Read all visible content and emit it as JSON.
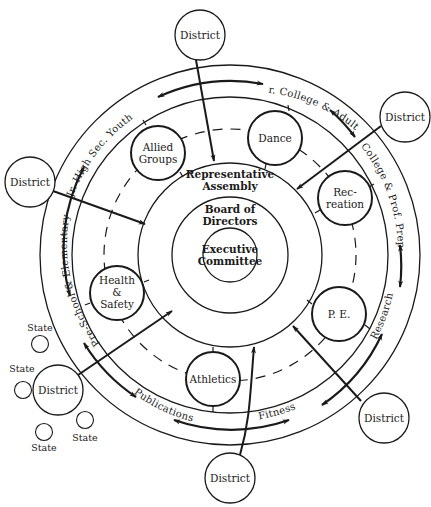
{
  "diagram": {
    "type": "organizational-concentric",
    "center": {
      "x": 230,
      "y": 255
    },
    "colors": {
      "line": "#1a1a1a",
      "background": "#ffffff"
    },
    "core": {
      "executive_committee": {
        "line1": "Executive",
        "line2": "Committee"
      },
      "board_of_directors": {
        "line1": "Board of",
        "line2": "Directors"
      },
      "representative_assembly": {
        "line1": "Representative",
        "line2": "Assembly"
      }
    },
    "divisions": [
      {
        "id": "allied-groups",
        "line1": "Allied",
        "line2": "Groups",
        "line3": ""
      },
      {
        "id": "dance",
        "line1": "Dance",
        "line2": "",
        "line3": ""
      },
      {
        "id": "recreation",
        "line1": "Rec-",
        "line2": "reation",
        "line3": ""
      },
      {
        "id": "pe",
        "line1": "P. E.",
        "line2": "",
        "line3": ""
      },
      {
        "id": "athletics",
        "line1": "Athletics",
        "line2": "",
        "line3": ""
      },
      {
        "id": "health-safety",
        "line1": "Health",
        "line2": "&",
        "line3": "Safety"
      }
    ],
    "ring_labels": {
      "jr_high": "Jr. High Sec. Youth",
      "jr_college": "Jr. College & Adults",
      "college": "College & Prof. Prep.",
      "research": "Research",
      "fitness": "Fitness",
      "publications": "Publications",
      "preschool": "Pre-School & Elementary"
    },
    "districts": [
      {
        "id": "district-top",
        "label": "District"
      },
      {
        "id": "district-upper-right",
        "label": "District"
      },
      {
        "id": "district-left",
        "label": "District"
      },
      {
        "id": "district-lower-left",
        "label": "District"
      },
      {
        "id": "district-lower-right",
        "label": "District"
      },
      {
        "id": "district-bottom",
        "label": "District"
      }
    ],
    "states": [
      {
        "label": "State"
      },
      {
        "label": "State"
      },
      {
        "label": "State"
      },
      {
        "label": "State"
      }
    ]
  }
}
